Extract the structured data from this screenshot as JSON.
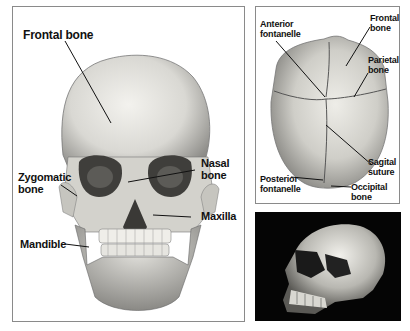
{
  "figure": {
    "panels": [
      {
        "id": "front-view",
        "description": "Anterior view of adult human skull",
        "labels": {
          "frontal_bone": "Frontal bone",
          "nasal_bone_line1": "Nasal",
          "nasal_bone_line2": "bone",
          "zygomatic_bone_line1": "Zygomatic",
          "zygomatic_bone_line2": "bone",
          "maxilla": "Maxilla",
          "mandible": "Mandible"
        }
      },
      {
        "id": "top-view",
        "description": "Superior view of infant skull",
        "labels": {
          "anterior_fontanelle_line1": "Anterior",
          "anterior_fontanelle_line2": "fontanelle",
          "frontal_bone_line1": "Frontal",
          "frontal_bone_line2": "bone",
          "parietal_bone_line1": "Parietal",
          "parietal_bone_line2": "bone",
          "sagital_suture_line1": "Sagital",
          "sagital_suture_line2": "suture",
          "posterior_fontanelle_line1": "Posterior",
          "posterior_fontanelle_line2": "fontanelle",
          "occipital_bone_line1": "Occipital",
          "occipital_bone_line2": "bone"
        }
      },
      {
        "id": "photo",
        "description": "Photograph of skull, three-quarter view on black background"
      }
    ],
    "colors": {
      "border": "#8a8a8a",
      "bone_light": "#ecebe6",
      "bone_mid": "#c9c8c2",
      "bone_dark": "#6f6e6a",
      "photo_bg": "#050505",
      "label": "#111111"
    }
  }
}
